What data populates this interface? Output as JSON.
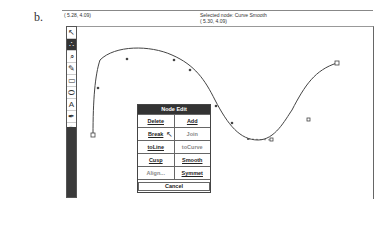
{
  "figure_label": "b.",
  "status": {
    "cursor_coord": "( 5.28, 4.09)",
    "selected_node": "Selected node: Curve   Smooth",
    "node_coord": "( 5.30, 4.09)"
  },
  "toolbar": {
    "tools": [
      {
        "name": "pointer-tool",
        "glyph": "↖",
        "active": false
      },
      {
        "name": "node-edit-tool",
        "glyph": "∴",
        "active": true
      },
      {
        "name": "zoom-tool",
        "glyph": "⌕",
        "active": false
      },
      {
        "name": "pencil-tool",
        "glyph": "✎",
        "active": false
      },
      {
        "name": "rectangle-tool",
        "glyph": "▭",
        "active": false
      },
      {
        "name": "ellipse-tool",
        "glyph": "⬭",
        "active": false
      },
      {
        "name": "text-tool",
        "glyph": "A",
        "active": false
      },
      {
        "name": "outline-pen-tool",
        "glyph": "✒",
        "active": false
      },
      {
        "name": "fill-tool",
        "glyph": "♨",
        "active": false
      }
    ]
  },
  "dialog": {
    "title": "Node Edit",
    "rows": [
      [
        {
          "label": "Delete",
          "enabled": true
        },
        {
          "label": "Add",
          "enabled": true
        }
      ],
      [
        {
          "label": "Break",
          "enabled": true
        },
        {
          "label": "Join",
          "enabled": false
        }
      ],
      [
        {
          "label": "toLine",
          "enabled": true
        },
        {
          "label": "toCurve",
          "enabled": false
        }
      ],
      [
        {
          "label": "Cusp",
          "enabled": true
        },
        {
          "label": "Smooth",
          "enabled": true
        }
      ],
      [
        {
          "label": "Align...",
          "enabled": false
        },
        {
          "label": "Symmet",
          "enabled": true
        }
      ]
    ],
    "cancel": "Cancel"
  },
  "colors": {
    "toolbar_dark": "#3a3a3a",
    "curve": "#444444"
  }
}
